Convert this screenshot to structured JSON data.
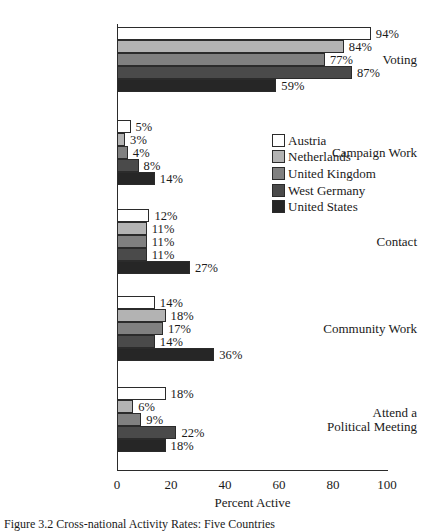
{
  "chart_data": {
    "type": "bar",
    "orientation": "horizontal",
    "title": "",
    "xlabel": "Percent Active",
    "ylabel": "",
    "xlim": [
      0,
      100
    ],
    "xticks": [
      0,
      20,
      40,
      60,
      80,
      100
    ],
    "grid": false,
    "legend_position": "inside-right",
    "categories": [
      "Voting",
      "Campaign Work",
      "Contact",
      "Community Work",
      "Attend a\nPolitical Meeting"
    ],
    "series": [
      {
        "name": "Austria",
        "color": "#ffffff",
        "values": [
          94,
          5,
          12,
          14,
          18
        ]
      },
      {
        "name": "Netherlands",
        "color": "#b3b3b3",
        "values": [
          84,
          3,
          11,
          18,
          6
        ]
      },
      {
        "name": "United Kingdom",
        "color": "#808080",
        "values": [
          77,
          4,
          11,
          17,
          9
        ]
      },
      {
        "name": "West Germany",
        "color": "#4a4a4a",
        "values": [
          87,
          8,
          11,
          14,
          22
        ]
      },
      {
        "name": "United States",
        "color": "#262626",
        "values": [
          59,
          14,
          27,
          36,
          18
        ]
      }
    ],
    "data_labels": {
      "Voting": [
        "94%",
        "84%",
        "77%",
        "87%",
        "59%"
      ],
      "Campaign Work": [
        "5%",
        "3%",
        "4%",
        "8%",
        "14%"
      ],
      "Contact": [
        "12%",
        "11%",
        "11%",
        "11%",
        "27%"
      ],
      "Community Work": [
        "14%",
        "18%",
        "17%",
        "14%",
        "36%"
      ],
      "Attend a Political Meeting": [
        "18%",
        "6%",
        "9%",
        "22%",
        "18%"
      ]
    }
  },
  "axis": {
    "tick_labels": [
      "0",
      "20",
      "40",
      "60",
      "80",
      "100"
    ],
    "x_title": "Percent Active"
  },
  "legend": {
    "items": [
      {
        "label": "Austria"
      },
      {
        "label": "Netherlands"
      },
      {
        "label": "United Kingdom"
      },
      {
        "label": "West Germany"
      },
      {
        "label": "United States"
      }
    ]
  },
  "caption": {
    "text": "Figure 3.2  Cross-national Activity Rates: Five Countries"
  },
  "colors": {
    "axis": "#2b2b2b",
    "text": "#1a1a1a",
    "background": "#ffffff"
  }
}
